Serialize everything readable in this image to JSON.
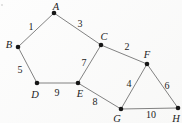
{
  "figure": {
    "colors": {
      "background": "#fdfdfd",
      "edge": "#747474",
      "node": "#161616",
      "text": "#1d1d1d"
    },
    "node_radius": 2.3,
    "speck": {
      "x": 2,
      "y": 5
    },
    "nodes": [
      {
        "id": "A",
        "x": 54,
        "y": 13,
        "lx": 56,
        "ly": 6
      },
      {
        "id": "B",
        "x": 18,
        "y": 47,
        "lx": 9,
        "ly": 44
      },
      {
        "id": "C",
        "x": 101,
        "y": 45,
        "lx": 104,
        "ly": 36
      },
      {
        "id": "D",
        "x": 37,
        "y": 83,
        "lx": 35,
        "ly": 94
      },
      {
        "id": "E",
        "x": 78,
        "y": 83,
        "lx": 80,
        "ly": 93
      },
      {
        "id": "F",
        "x": 147,
        "y": 64,
        "lx": 147,
        "ly": 54
      },
      {
        "id": "G",
        "x": 121,
        "y": 109,
        "lx": 117,
        "ly": 118
      },
      {
        "id": "H",
        "x": 178,
        "y": 108,
        "lx": 176,
        "ly": 118
      }
    ],
    "edges": [
      {
        "from": "A",
        "to": "B",
        "weight": "1",
        "wx": 31,
        "wy": 26
      },
      {
        "from": "A",
        "to": "C",
        "weight": "3",
        "wx": 80,
        "wy": 23
      },
      {
        "from": "B",
        "to": "D",
        "weight": "5",
        "wx": 20,
        "wy": 69
      },
      {
        "from": "D",
        "to": "E",
        "weight": "9",
        "wx": 57,
        "wy": 92
      },
      {
        "from": "C",
        "to": "E",
        "weight": "7",
        "wx": 84,
        "wy": 62
      },
      {
        "from": "C",
        "to": "F",
        "weight": "2",
        "wx": 127,
        "wy": 46
      },
      {
        "from": "E",
        "to": "G",
        "weight": "8",
        "wx": 95,
        "wy": 101
      },
      {
        "from": "F",
        "to": "G",
        "weight": "4",
        "wx": 129,
        "wy": 83
      },
      {
        "from": "F",
        "to": "H",
        "weight": "6",
        "wx": 167,
        "wy": 85
      },
      {
        "from": "G",
        "to": "H",
        "weight": "10",
        "wx": 151,
        "wy": 114
      }
    ]
  }
}
